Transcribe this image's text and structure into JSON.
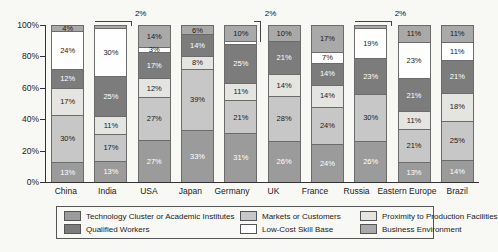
{
  "chart_data": {
    "type": "bar",
    "stacked": true,
    "unit": "%",
    "title": "",
    "xlabel": "",
    "ylabel": "",
    "ylim": [
      0,
      100
    ],
    "grid": false,
    "legend_position": "bottom",
    "y_ticks": [
      "100%",
      "80%",
      "60%",
      "40%",
      "20%",
      "0%"
    ],
    "categories": [
      "China",
      "India",
      "USA",
      "Japan",
      "Germany",
      "UK",
      "France",
      "Russia",
      "Eastern Europe",
      "Brazil"
    ],
    "series": [
      {
        "name": "Technology Cluster or Academic Institutes",
        "color": "#9b9b9b",
        "label_color": "#ffffff",
        "values": [
          13,
          13,
          27,
          33,
          31,
          26,
          24,
          26,
          13,
          14
        ]
      },
      {
        "name": "Markets or Customers",
        "color": "#c7c7c7",
        "label_color": "#1a1a1a",
        "values": [
          30,
          17,
          27,
          39,
          21,
          28,
          24,
          30,
          21,
          25
        ]
      },
      {
        "name": "Proximity to Production Facilities",
        "color": "#e4e4e1",
        "label_color": "#1a1a1a",
        "values": [
          17,
          11,
          12,
          8,
          11,
          14,
          14,
          0,
          11,
          18
        ]
      },
      {
        "name": "Qualified Workers",
        "color": "#7c7c7c",
        "label_color": "#ffffff",
        "values": [
          12,
          25,
          17,
          14,
          25,
          21,
          14,
          23,
          21,
          21
        ]
      },
      {
        "name": "Low-Cost Skill Base",
        "color": "#fefefe",
        "label_color": "#1a1a1a",
        "values": [
          24,
          30,
          3,
          0,
          2,
          0,
          7,
          19,
          23,
          11
        ]
      },
      {
        "name": "Business Environment",
        "color": "#a9a9a9",
        "label_color": "#1a1a1a",
        "values": [
          4,
          2,
          14,
          6,
          10,
          10,
          17,
          2,
          11,
          11
        ]
      }
    ],
    "callouts": [
      {
        "category": "India",
        "series": "Business Environment",
        "label": "2%",
        "style": "top",
        "drop_pct": 0
      },
      {
        "category": "Germany",
        "series": "Low-Cost Skill Base",
        "label": "2%",
        "style": "side",
        "drop_pct": 10
      },
      {
        "category": "Russia",
        "series": "Business Environment",
        "label": "2%",
        "style": "top",
        "drop_pct": 0
      }
    ],
    "segment_label_min_value": 3,
    "legend_entries": [
      "Technology Cluster or Academic Institutes",
      "Markets or Customers",
      "Proximity to Production Facilities",
      "Qualified Workers",
      "Low-Cost Skill Base",
      "Business Environment"
    ]
  }
}
